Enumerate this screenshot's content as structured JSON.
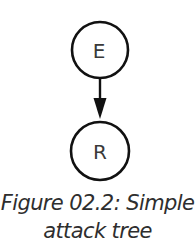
{
  "diagram": {
    "nodes": [
      {
        "id": "E",
        "label": "E",
        "cx": 100,
        "cy": 50,
        "r": 28
      },
      {
        "id": "R",
        "label": "R",
        "cx": 100,
        "cy": 151,
        "r": 29
      }
    ],
    "edges": [
      {
        "from": "E",
        "to": "R",
        "directed": true
      }
    ],
    "colors": {
      "stroke": "#111111",
      "label": "#3a3a3a",
      "background": "#ffffff"
    }
  },
  "caption": {
    "line1": "Figure 02.2: Simple",
    "line2": "attack tree"
  }
}
